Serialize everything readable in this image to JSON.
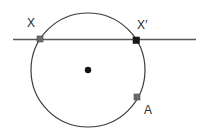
{
  "figure": {
    "canvas": {
      "width": 208,
      "height": 128,
      "background": "#ffffff"
    },
    "labels": {
      "x": "X",
      "x_prime": "X′",
      "a": "A"
    },
    "colors": {
      "stroke": "#3c3c3c",
      "line": "#5a5a52",
      "point_light": "#6b6b6b",
      "point_dark": "#1a1a1a",
      "center_dot": "#111111",
      "label_text": "#2b2b2b"
    },
    "circle": {
      "center_x": 88,
      "center_y": 70,
      "radius": 57,
      "stroke_width": 1.2
    },
    "secant_line": {
      "x1": 13,
      "y1": 39.5,
      "x2": 196,
      "y2": 39.5,
      "stroke_width": 1.6
    },
    "points": [
      {
        "name": "X",
        "x": 40,
        "y": 39,
        "size": 6,
        "fill": "#6b6b6b"
      },
      {
        "name": "X′",
        "x": 136,
        "y": 40,
        "size": 6,
        "fill": "#1a1a1a"
      },
      {
        "name": "A",
        "x": 137,
        "y": 97,
        "size": 6,
        "fill": "#6b6b6b"
      },
      {
        "name": "center",
        "x": 88,
        "y": 70,
        "size": 6,
        "fill": "#111111"
      }
    ]
  }
}
